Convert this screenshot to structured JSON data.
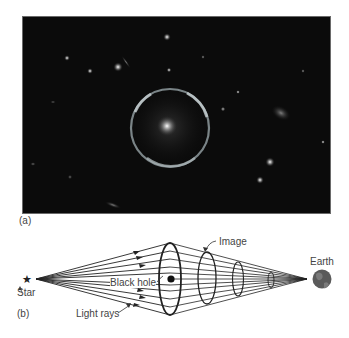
{
  "figure": {
    "panel_a": {
      "label": "(a)",
      "description": "Hubble image of an Einstein ring gravitational lens"
    },
    "panel_b": {
      "label": "(b)",
      "labels": {
        "star": "Star",
        "black_hole": "Black hole",
        "light_rays": "Light rays",
        "image": "Image",
        "earth": "Earth"
      }
    }
  },
  "colors": {
    "photo_bg": "#0b0b0b",
    "ring": "#b8c4c8",
    "line": "#222222",
    "earth": "#5a5a5a"
  }
}
